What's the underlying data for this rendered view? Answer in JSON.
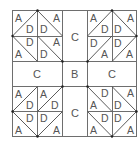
{
  "diagram": {
    "colors": {
      "line": "#6e6e6e",
      "text": "#555555",
      "background": "#ffffff"
    },
    "frame": {
      "x": 12,
      "y": 10,
      "width": 125,
      "height": 127
    },
    "center": {
      "label": "B"
    },
    "sashing": {
      "top": {
        "label": "C"
      },
      "left": {
        "label": "C"
      },
      "right": {
        "label": "C"
      },
      "bottom": {
        "label": "C"
      }
    },
    "quadrants": {
      "top_left": {
        "units": [
          {
            "pos": "top-left",
            "diagonal": "/",
            "upper": "A",
            "lower": "D"
          },
          {
            "pos": "top-right",
            "diagonal": "\\",
            "upper": "A",
            "lower": "D"
          },
          {
            "pos": "bottom-left",
            "diagonal": "\\",
            "upper": "D",
            "lower": "A"
          },
          {
            "pos": "bottom-right",
            "diagonal": "\\",
            "upper": "A",
            "lower": "D"
          }
        ]
      },
      "top_right": {
        "units": [
          {
            "pos": "top-left",
            "diagonal": "/",
            "upper": "A",
            "lower": "D"
          },
          {
            "pos": "top-right",
            "diagonal": "\\",
            "upper": "A",
            "lower": "D"
          },
          {
            "pos": "bottom-left",
            "diagonal": "/",
            "upper": "D",
            "lower": "A"
          },
          {
            "pos": "bottom-right",
            "diagonal": "/",
            "upper": "D",
            "lower": "A"
          }
        ]
      },
      "bottom_left": {
        "units": [
          {
            "pos": "top-left",
            "diagonal": "/",
            "upper": "A",
            "lower": "D"
          },
          {
            "pos": "top-right",
            "diagonal": "/",
            "upper": "A",
            "lower": "D"
          },
          {
            "pos": "bottom-left",
            "diagonal": "\\",
            "upper": "D",
            "lower": "A"
          },
          {
            "pos": "bottom-right",
            "diagonal": "/",
            "upper": "D",
            "lower": "A"
          }
        ]
      },
      "bottom_right": {
        "units": [
          {
            "pos": "top-left",
            "diagonal": "\\",
            "upper": "D",
            "lower": "A"
          },
          {
            "pos": "top-right",
            "diagonal": "\\",
            "upper": "A",
            "lower": "D"
          },
          {
            "pos": "bottom-left",
            "diagonal": "\\",
            "upper": "D",
            "lower": "A"
          },
          {
            "pos": "bottom-right",
            "diagonal": "/",
            "upper": "D",
            "lower": "A"
          }
        ]
      }
    }
  }
}
